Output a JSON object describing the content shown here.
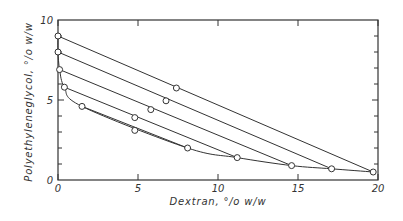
{
  "chart_data": {
    "type": "scatter",
    "title": "",
    "xlabel": "Dextran, % w/w",
    "ylabel": "Polyethyleneglycol, % w/w",
    "xlim": [
      0,
      20
    ],
    "ylim": [
      0,
      10
    ],
    "xticks": [
      0,
      5,
      10,
      15,
      20
    ],
    "yticks": [
      0,
      5,
      10
    ],
    "grid": false,
    "binodal": [
      {
        "x": 0.0,
        "y": 9.0
      },
      {
        "x": 0.0,
        "y": 8.0
      },
      {
        "x": 0.1,
        "y": 6.9
      },
      {
        "x": 0.4,
        "y": 5.8
      },
      {
        "x": 1.5,
        "y": 4.6
      },
      {
        "x": 8.1,
        "y": 2.0
      },
      {
        "x": 11.2,
        "y": 1.4
      },
      {
        "x": 14.6,
        "y": 0.9
      },
      {
        "x": 17.1,
        "y": 0.7
      },
      {
        "x": 19.7,
        "y": 0.5
      }
    ],
    "tie_lines": [
      {
        "top": {
          "x": 0.0,
          "y": 9.0
        },
        "mid": {
          "x": 7.4,
          "y": 5.75
        },
        "bottom": {
          "x": 19.7,
          "y": 0.5
        }
      },
      {
        "top": {
          "x": 0.0,
          "y": 8.0
        },
        "mid": {
          "x": 6.75,
          "y": 4.95
        },
        "bottom": {
          "x": 17.1,
          "y": 0.7
        }
      },
      {
        "top": {
          "x": 0.1,
          "y": 6.9
        },
        "mid": {
          "x": 5.8,
          "y": 4.4
        },
        "bottom": {
          "x": 14.6,
          "y": 0.9
        }
      },
      {
        "top": {
          "x": 0.4,
          "y": 5.8
        },
        "mid": {
          "x": 4.8,
          "y": 3.9
        },
        "bottom": {
          "x": 11.2,
          "y": 1.4
        }
      },
      {
        "top": {
          "x": 1.5,
          "y": 4.6
        },
        "mid": {
          "x": 4.8,
          "y": 3.1
        },
        "bottom": {
          "x": 8.1,
          "y": 2.0
        }
      }
    ]
  },
  "labels": {
    "xlabel": "Dextran, °/o  w/w",
    "ylabel": "Polyethyleneglycol, °/o  w/w",
    "xtick_labels": [
      "0",
      "5",
      "10",
      "15",
      "20"
    ],
    "ytick_labels": [
      "0",
      "5",
      "10"
    ]
  }
}
